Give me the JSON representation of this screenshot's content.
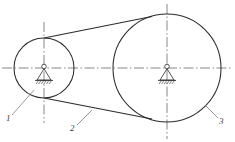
{
  "drawing": {
    "title": "Belt drive with two pulleys on pin supports",
    "type": "engineering-line-diagram",
    "canvas": {
      "width": 235,
      "height": 142,
      "background": "#ffffff"
    },
    "stroke_color": "#2b2b2b",
    "centerline_color": "#555555",
    "leader_color": "#6b6b6b"
  },
  "pulleys": [
    {
      "id": "small-pulley",
      "label_ref": "1",
      "center_x": 44,
      "center_y": 68,
      "radius": 30
    },
    {
      "id": "large-pulley",
      "label_ref": "3",
      "center_x": 167,
      "center_y": 68,
      "radius": 54
    }
  ],
  "belt": {
    "id": "belt",
    "label_ref": "2",
    "upper_tangent": {
      "x1": 44,
      "y1": 38,
      "x2": 150,
      "y2": 17
    },
    "lower_tangent": {
      "x1": 44,
      "y1": 98,
      "x2": 150,
      "y2": 118
    }
  },
  "supports": [
    {
      "id": "support-small",
      "x": 44,
      "y": 68,
      "type": "pin-support"
    },
    {
      "id": "support-large",
      "x": 167,
      "y": 68,
      "type": "pin-support"
    }
  ],
  "centerlines": {
    "horizontal": {
      "x1": 2,
      "y1": 68,
      "x2": 233,
      "y2": 68
    },
    "vertical_small": {
      "x": 44,
      "y1": 22,
      "y2": 123
    },
    "vertical_large": {
      "x": 167,
      "y1": 4,
      "y2": 139
    }
  },
  "callouts": [
    {
      "id": "callout-1",
      "text": "1",
      "text_x": 6,
      "text_y": 121,
      "leader": {
        "x1": 12,
        "y1": 115,
        "x2": 34,
        "y2": 90
      }
    },
    {
      "id": "callout-2",
      "text": "2",
      "text_x": 70,
      "text_y": 131,
      "leader": {
        "x1": 77,
        "y1": 125,
        "x2": 92,
        "y2": 110
      }
    },
    {
      "id": "callout-3",
      "text": "3",
      "text_x": 219,
      "text_y": 124,
      "leader": {
        "x1": 218,
        "y1": 118,
        "x2": 205,
        "y2": 105
      }
    }
  ]
}
